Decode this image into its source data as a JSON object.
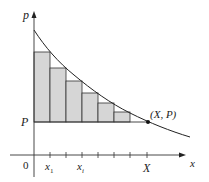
{
  "diagram": {
    "axes": {
      "y_label": "p",
      "x_label": "x",
      "origin_label": "0"
    },
    "levels": {
      "P_label": "P"
    },
    "x_ticks": {
      "x1_label": "x",
      "x1_sub": "1",
      "xi_label": "x",
      "xi_sub": "i",
      "X_label": "X"
    },
    "point_label": "(X, P)",
    "colors": {
      "line": "#222222",
      "fill": "#d6d6d6",
      "background": "#ffffff"
    },
    "rectangles": [
      {
        "x0": 34,
        "x1": 50,
        "top": 52
      },
      {
        "x0": 50,
        "x1": 66,
        "top": 68
      },
      {
        "x0": 66,
        "x1": 82,
        "top": 81
      },
      {
        "x0": 82,
        "x1": 98,
        "top": 93
      },
      {
        "x0": 98,
        "x1": 114,
        "top": 103
      },
      {
        "x0": 114,
        "x1": 130,
        "top": 112
      }
    ]
  }
}
